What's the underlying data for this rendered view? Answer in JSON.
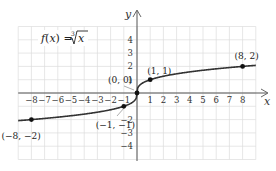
{
  "chart_data": {
    "type": "line",
    "title_parts": {
      "fn": "f",
      "open": "(",
      "var": "x",
      "close": ") = ",
      "radical_index": "3",
      "radicand": "x"
    },
    "xlabel": "x",
    "ylabel": "y",
    "xlim": [
      -9,
      9
    ],
    "ylim": [
      -5,
      5
    ],
    "grid": true,
    "x_ticks": [
      -8,
      -7,
      -6,
      -5,
      -4,
      -3,
      -2,
      -1,
      1,
      2,
      3,
      4,
      5,
      6,
      7,
      8
    ],
    "x_tick_labels": [
      "−8",
      "−7",
      "−6",
      "−5",
      "−4",
      "−3",
      "−2",
      "−1",
      "1",
      "2",
      "3",
      "4",
      "5",
      "6",
      "7",
      "8"
    ],
    "y_ticks": [
      4,
      3,
      2,
      1,
      -2,
      -3,
      -4
    ],
    "y_tick_labels": [
      "4",
      "3",
      "2",
      "1",
      "−2",
      "−3",
      "−4"
    ],
    "series": [
      {
        "name": "f(x) = ∛x",
        "function": "cbrt",
        "x_range": [
          -9,
          9
        ]
      }
    ],
    "points": [
      {
        "x": -8,
        "y": -2,
        "label": "(−8, −2)"
      },
      {
        "x": -1,
        "y": -1,
        "label": "(−1, −1)"
      },
      {
        "x": 0,
        "y": 0,
        "label": "(0, 0)"
      },
      {
        "x": 1,
        "y": 1,
        "label": "(1, 1)"
      },
      {
        "x": 8,
        "y": 2,
        "label": "(8, 2)"
      }
    ],
    "colors": {
      "curve": "#333333",
      "grid": "#dcdcdc",
      "axis": "#555555",
      "point": "#111111"
    }
  }
}
